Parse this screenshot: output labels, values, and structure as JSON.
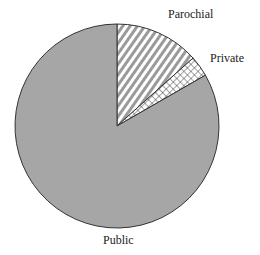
{
  "chart_data": {
    "type": "pie",
    "title": "",
    "categories": [
      "Parochial",
      "Private",
      "Public"
    ],
    "values": [
      13.4,
      3.3,
      83.3
    ],
    "units": "percent (estimated from slice angles)",
    "start_angle_deg": 0,
    "direction": "clockwise",
    "fills": {
      "Parochial": "diagonal-stripes",
      "Private": "crosshatch",
      "Public": "solid-gray"
    },
    "legend": "none (direct labels)"
  },
  "labels": {
    "parochial": "Parochial",
    "private": "Private",
    "public": "Public"
  },
  "colors": {
    "public_fill": "#a6a6a6",
    "outline": "#333333",
    "stripe": "#9a9a9a"
  }
}
